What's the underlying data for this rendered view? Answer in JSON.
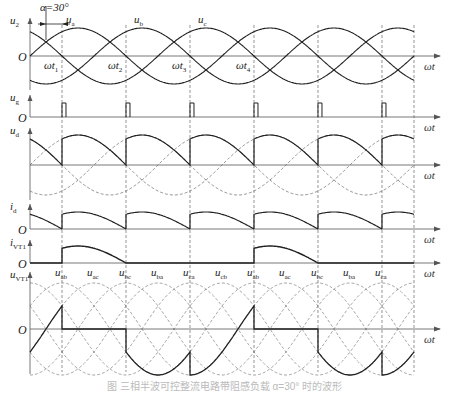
{
  "figure": {
    "alpha_label": "α=30°",
    "omega_t_label": "ωt",
    "origin_label": "O",
    "caption": "图 三相半波可控整流电路带阻感负载 α=30° 时的波形"
  },
  "geometry": {
    "x0": 30,
    "x_end": 414,
    "px_per_deg": 0.5333,
    "alpha_deg": 30,
    "period_px": 192
  },
  "panels": [
    {
      "id": "u2",
      "label_main": "u",
      "label_sub": "2",
      "zero_y": 56,
      "amp": 28,
      "top_y": 18
    },
    {
      "id": "ug",
      "label_main": "u",
      "label_sub": "g",
      "zero_y": 117,
      "pulse_h": 14,
      "top_y": 95
    },
    {
      "id": "ud",
      "label_main": "u",
      "label_sub": "d",
      "zero_y": 165,
      "amp": 30,
      "top_y": 128
    },
    {
      "id": "id",
      "label_main": "i",
      "label_sub": "d",
      "zero_y": 229,
      "amp": 20,
      "top_y": 204
    },
    {
      "id": "ivt1",
      "label_main": "i",
      "label_sub": "VT1",
      "zero_y": 263,
      "amp": 20,
      "top_y": 240
    },
    {
      "id": "uvt1",
      "label_main": "u",
      "label_sub": "VT1",
      "zero_y": 329,
      "amp": 46,
      "top_y": 272
    }
  ],
  "phase_labels": [
    {
      "main": "u",
      "sub": "a",
      "x": 66,
      "y": 14
    },
    {
      "main": "u",
      "sub": "b",
      "x": 134,
      "y": 14
    },
    {
      "main": "u",
      "sub": "c",
      "x": 198,
      "y": 14
    }
  ],
  "time_marks": [
    {
      "main": "ωt",
      "sub": "1",
      "x": 44,
      "y": 60
    },
    {
      "main": "ωt",
      "sub": "2",
      "x": 108,
      "y": 60
    },
    {
      "main": "ωt",
      "sub": "3",
      "x": 172,
      "y": 60
    },
    {
      "main": "ωt",
      "sub": "4",
      "x": 236,
      "y": 60
    }
  ],
  "line_voltage_labels": [
    {
      "main": "u",
      "sub": "ab",
      "x": 55
    },
    {
      "main": "u",
      "sub": "ac",
      "x": 87
    },
    {
      "main": "u",
      "sub": "bc",
      "x": 119
    },
    {
      "main": "u",
      "sub": "ba",
      "x": 151
    },
    {
      "main": "u",
      "sub": "ca",
      "x": 183
    },
    {
      "main": "u",
      "sub": "cb",
      "x": 215
    },
    {
      "main": "u",
      "sub": "ab",
      "x": 247
    },
    {
      "main": "u",
      "sub": "ac",
      "x": 279
    },
    {
      "main": "u",
      "sub": "bc",
      "x": 311
    },
    {
      "main": "u",
      "sub": "ba",
      "x": 343
    },
    {
      "main": "u",
      "sub": "ca",
      "x": 375
    }
  ],
  "colors": {
    "solid": "#222222",
    "dashed": "#666666",
    "axis": "#555555",
    "caption": "#bbbbbb"
  }
}
